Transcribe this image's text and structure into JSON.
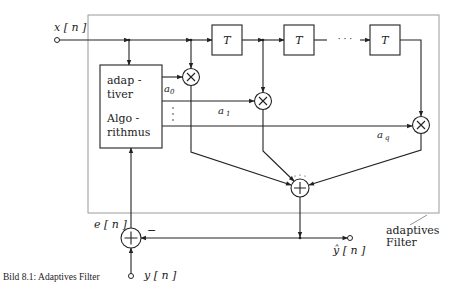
{
  "diagram": {
    "title": "Adaptives Filter",
    "caption": "Bild 8.1:  Adaptives Filter",
    "signals": {
      "input": "x [ n ]",
      "desired": "y [ n ]",
      "error": "e [ n ]",
      "output": "ŷ [ n ]"
    },
    "algorithm_block": {
      "line1": "adap -",
      "line2": "tiver",
      "line3": "Algo -",
      "line4": "rithmus"
    },
    "delay_blocks": [
      {
        "label": "T"
      },
      {
        "label": "T"
      },
      {
        "label": "T"
      }
    ],
    "delay_ellipsis": "· · ·",
    "coefficients": [
      {
        "name": "a",
        "sub": "0"
      },
      {
        "name": "a",
        "sub": "1"
      },
      {
        "name": "a",
        "sub": "q"
      }
    ],
    "coef_ellipsis": "⋮",
    "multiplier_symbol": "×",
    "adder_symbol": "+",
    "minus_sign": "−",
    "frame_label": {
      "line1": "adaptives",
      "line2": "Filter"
    }
  }
}
